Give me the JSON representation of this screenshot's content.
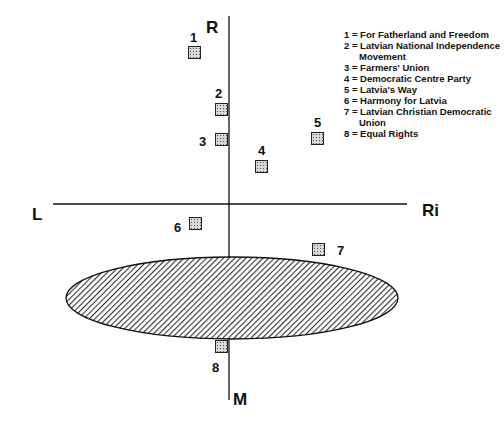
{
  "axes": {
    "top": "R",
    "bottom": "M",
    "left": "L",
    "right": "Ri"
  },
  "parties": [
    {
      "id": "1",
      "name": "For Fatherland and Freedom",
      "x": 195,
      "y": 47
    },
    {
      "id": "2",
      "name": "Latvian National Independence Movement",
      "x": 222,
      "y": 103
    },
    {
      "id": "3",
      "name": "Farmers' Union",
      "x": 222,
      "y": 133
    },
    {
      "id": "4",
      "name": "Democratic Centre Party",
      "x": 261,
      "y": 159
    },
    {
      "id": "5",
      "name": "Latvia's Way",
      "x": 317,
      "y": 132
    },
    {
      "id": "6",
      "name": "Harmony for Latvia",
      "x": 196,
      "y": 218
    },
    {
      "id": "7",
      "name": "Latvian Christian Democratic Union",
      "x": 319,
      "y": 250
    },
    {
      "id": "8",
      "name": "Equal Rights",
      "x": 222,
      "y": 342
    }
  ],
  "legend": [
    {
      "line": "1 = For Fatherland and Freedom"
    },
    {
      "line": "2 = Latvian National Independence",
      "cont": "Movement"
    },
    {
      "line": "3 = Farmers' Union"
    },
    {
      "line": "4 = Democratic Centre Party"
    },
    {
      "line": "5 = Latvia's Way"
    },
    {
      "line": "6 = Harmony for Latvia"
    },
    {
      "line": "7 = Latvian Christian Democratic",
      "cont": "Union"
    },
    {
      "line": "8 = Equal Rights"
    }
  ]
}
